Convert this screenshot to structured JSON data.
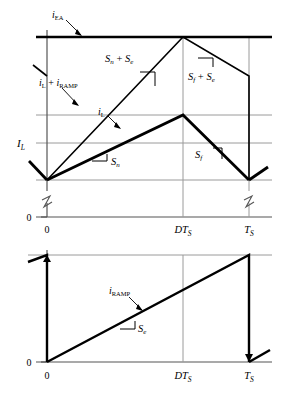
{
  "figure": {
    "title": "",
    "panels": [
      {
        "id": "upper-panel",
        "name": "current-waveforms-panel",
        "axis": {
          "x_ticks": [
            {
              "label": "0",
              "x": 0.0
            },
            {
              "label": "DTS",
              "x": 0.5
            },
            {
              "label": "TS",
              "x": 0.8
            }
          ],
          "y_origin_label": "0",
          "y_level_label": "IL",
          "has_axis_break": true
        },
        "curves": [
          {
            "name": "iEA",
            "label": "iEA",
            "type": "constant",
            "level": 1.0,
            "style": "bold-horizontal"
          },
          {
            "name": "iL-plus-iRAMP",
            "label": "iL + iRAMP",
            "type": "triangle",
            "valley": 0.0,
            "peak": 1.0,
            "peak_x": 0.5,
            "end_x": 0.8,
            "end_level": 0.72,
            "style": "thin"
          },
          {
            "name": "iL",
            "label": "iL",
            "type": "triangle",
            "valley": 0.0,
            "peak": 0.56,
            "peak_x": 0.5,
            "end_x": 0.8,
            "end_level": 0.0,
            "style": "bold"
          }
        ],
        "slope_labels": [
          {
            "name": "slope-sn-plus-se",
            "text": "Sn + Se"
          },
          {
            "name": "slope-sf-plus-se",
            "text": "Sf + Se"
          },
          {
            "name": "slope-sn",
            "text": "Sn"
          },
          {
            "name": "slope-sf",
            "text": "Sf"
          }
        ]
      },
      {
        "id": "lower-panel",
        "name": "ramp-waveform-panel",
        "axis": {
          "x_ticks": [
            {
              "label": "0",
              "x": 0.0
            },
            {
              "label": "DTS",
              "x": 0.5
            },
            {
              "label": "TS",
              "x": 0.8
            }
          ],
          "y_origin_label": "0"
        },
        "curves": [
          {
            "name": "iRAMP",
            "label": "iRAMP",
            "type": "sawtooth",
            "start": 0.0,
            "end": 1.0,
            "period_x": 0.8,
            "style": "bold"
          }
        ],
        "slope_labels": [
          {
            "name": "slope-se",
            "text": "Se"
          }
        ]
      }
    ],
    "symbols": {
      "i_ea": "i",
      "i_ea_sub": "EA",
      "i_l": "i",
      "i_l_sub": "L",
      "i_ramp": "i",
      "i_ramp_sub": "RAMP",
      "plus": "+",
      "cap_i_l": "I",
      "cap_i_l_sub": "L",
      "s_n": "S",
      "s_n_sub": "n",
      "s_f": "S",
      "s_f_sub": "f",
      "s_e": "S",
      "s_e_sub": "e",
      "d_t_s": "DT",
      "t_s": "T",
      "t_s_sub": "S",
      "zero": "0"
    },
    "colors": {
      "curve": "#000000",
      "grid": "#9a9a9a",
      "axis": "#555555",
      "text": "#000000",
      "background": "#ffffff"
    }
  }
}
